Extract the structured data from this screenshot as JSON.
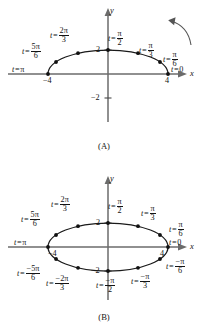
{
  "figure": {
    "type": "parametric-curve-diagram",
    "ink_color": "#141414",
    "axis_color": "#5a5a5a",
    "background": "#ffffff"
  },
  "panels": [
    {
      "id": "A",
      "caption": "(A)",
      "curve": "upper half of ellipse x = 4 cos t, y = 2 sin t",
      "axes": {
        "x_label": "x",
        "y_label": "y",
        "x_ticks": [
          {
            "value": -4,
            "text": "−4"
          },
          {
            "value": 4,
            "text": "4"
          }
        ],
        "y_ticks": [
          {
            "value": 2,
            "text": "2"
          },
          {
            "value": -2,
            "text": "−2"
          }
        ]
      },
      "direction_arrow": {
        "present": true,
        "sense": "counterclockwise",
        "name": "direction-arrow"
      },
      "points": [
        {
          "t_label": "t = 0",
          "t_num": "",
          "t_den": "",
          "t_whole": "0",
          "x": 4,
          "y": 0
        },
        {
          "t_label": "t = π/6",
          "t_num": "π",
          "t_den": "6",
          "t_whole": "",
          "x": 3.464,
          "y": 1
        },
        {
          "t_label": "t = π/3",
          "t_num": "π",
          "t_den": "3",
          "t_whole": "",
          "x": 2,
          "y": 1.732
        },
        {
          "t_label": "t = π/2",
          "t_num": "π",
          "t_den": "2",
          "t_whole": "",
          "x": 0,
          "y": 2
        },
        {
          "t_label": "t = 2π/3",
          "t_num": "2π",
          "t_den": "3",
          "t_whole": "",
          "x": -2,
          "y": 1.732
        },
        {
          "t_label": "t = 5π/6",
          "t_num": "5π",
          "t_den": "6",
          "t_whole": "",
          "x": -3.464,
          "y": 1
        },
        {
          "t_label": "t = π",
          "t_num": "",
          "t_den": "",
          "t_whole": "π",
          "x": -4,
          "y": 0
        }
      ]
    },
    {
      "id": "B",
      "caption": "(B)",
      "curve": "full ellipse x = 4 cos t, y = 2 sin t",
      "axes": {
        "x_label": "x",
        "y_label": "y",
        "x_ticks": [
          {
            "value": -4,
            "text": "−4"
          },
          {
            "value": 4,
            "text": "4"
          }
        ],
        "y_ticks": [
          {
            "value": 2,
            "text": "2"
          },
          {
            "value": -2,
            "text": "−2"
          }
        ]
      },
      "direction_arrow": {
        "present": false
      },
      "points": [
        {
          "t_label": "t = 0",
          "t_num": "",
          "t_den": "",
          "t_whole": "0",
          "x": 4,
          "y": 0
        },
        {
          "t_label": "t = π/6",
          "t_num": "π",
          "t_den": "6",
          "t_whole": "",
          "x": 3.464,
          "y": 1
        },
        {
          "t_label": "t = π/3",
          "t_num": "π",
          "t_den": "3",
          "t_whole": "",
          "x": 2,
          "y": 1.732
        },
        {
          "t_label": "t = π/2",
          "t_num": "π",
          "t_den": "2",
          "t_whole": "",
          "x": 0,
          "y": 2
        },
        {
          "t_label": "t = 2π/3",
          "t_num": "2π",
          "t_den": "3",
          "t_whole": "",
          "x": -2,
          "y": 1.732
        },
        {
          "t_label": "t = 5π/6",
          "t_num": "5π",
          "t_den": "6",
          "t_whole": "",
          "x": -3.464,
          "y": 1
        },
        {
          "t_label": "t = π",
          "t_num": "",
          "t_den": "",
          "t_whole": "π",
          "x": -4,
          "y": 0
        },
        {
          "t_label": "t = −5π/6",
          "t_num": "−5π",
          "t_den": "6",
          "t_whole": "",
          "x": -3.464,
          "y": -1
        },
        {
          "t_label": "t = −2π/3",
          "t_num": "−2π",
          "t_den": "3",
          "t_whole": "",
          "x": -2,
          "y": -1.732
        },
        {
          "t_label": "t = −π/2",
          "t_num": "−π",
          "t_den": "2",
          "t_whole": "",
          "x": 0,
          "y": -2
        },
        {
          "t_label": "t = −π/3",
          "t_num": "−π",
          "t_den": "3",
          "t_whole": "",
          "x": 2,
          "y": -1.732
        },
        {
          "t_label": "t = −π/6",
          "t_num": "−π",
          "t_den": "6",
          "t_whole": "",
          "x": 3.464,
          "y": -1
        }
      ]
    }
  ],
  "labels": {
    "t_var": "t",
    "equals": "=",
    "x_axis": "x",
    "y_axis": "y",
    "caption_a": "(A)",
    "caption_b": "(B)",
    "tick_4": "4",
    "tick_neg4": "−4",
    "tick_2": "2",
    "tick_neg2": "−2",
    "zero": "0",
    "pi": "π",
    "two_pi": "2π",
    "five_pi": "5π",
    "neg_pi": "−π",
    "neg_two_pi": "−2π",
    "neg_five_pi": "−5π",
    "den_2": "2",
    "den_3": "3",
    "den_6": "6"
  }
}
